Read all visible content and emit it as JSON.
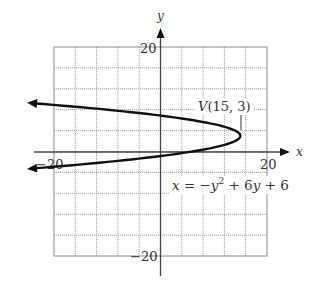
{
  "chart_data": {
    "type": "line",
    "title": "",
    "equation": "x = −y² + 6y + 6",
    "equation_parts": {
      "lhs": "x",
      "eq": " = −",
      "y1": "y",
      "sup": "2",
      "plus1": " + 6",
      "y2": "y",
      "plus2": " + 6"
    },
    "vertex": {
      "x": 15,
      "y": 3,
      "label_v": "V",
      "label_coords": "(15, 3)"
    },
    "xlabel": "x",
    "ylabel": "y",
    "xlim": [
      -20,
      20
    ],
    "ylim": [
      -20,
      20
    ],
    "grid": true,
    "grid_step": 4,
    "tick_labels": {
      "x_neg": "−20",
      "x_pos": "20",
      "y_pos": "20",
      "y_neg": "−20"
    },
    "series": [
      {
        "name": "x = −y² + 6y + 6",
        "points": [
          {
            "x": -24,
            "y": 9.24
          },
          {
            "x": -10,
            "y": 7.8
          },
          {
            "x": -1,
            "y": 7
          },
          {
            "x": 6,
            "y": 6
          },
          {
            "x": 11,
            "y": 5
          },
          {
            "x": 14,
            "y": 4
          },
          {
            "x": 15,
            "y": 3
          },
          {
            "x": 14,
            "y": 2
          },
          {
            "x": 11,
            "y": 1
          },
          {
            "x": 6,
            "y": 0
          },
          {
            "x": -1,
            "y": -1
          },
          {
            "x": -10,
            "y": -2
          },
          {
            "x": -24,
            "y": -3.24
          }
        ],
        "arrows_both_ends": true
      }
    ]
  }
}
